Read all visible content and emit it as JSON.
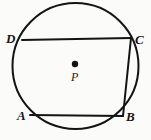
{
  "figure": {
    "type": "geometry-diagram",
    "width": 151,
    "height": 140,
    "background_color": "#fbfbfa",
    "stroke_color": "#141414",
    "fill_color": "none",
    "stroke_width": 2
  },
  "circle": {
    "name": "circle-P",
    "center_x": 75.5,
    "center_y": 66,
    "radius": 63,
    "stroke_color": "#141414",
    "stroke_width": 2
  },
  "center_point": {
    "name": "center-point-P",
    "label": "P",
    "dot_x": 75,
    "dot_y": 64,
    "dot_radius": 3.2,
    "color": "#141414"
  },
  "vertices": [
    {
      "label": "D",
      "x": 22,
      "y": 40,
      "label_x": 6,
      "label_y": 32
    },
    {
      "label": "C",
      "x": 131,
      "y": 38,
      "label_x": 135,
      "label_y": 33
    },
    {
      "label": "B",
      "x": 123,
      "y": 116,
      "label_x": 126,
      "label_y": 110
    },
    {
      "label": "A",
      "x": 30,
      "y": 115,
      "label_x": 17,
      "label_y": 109
    }
  ],
  "chords": [
    {
      "name": "chord-DC",
      "from": "D",
      "to": "C",
      "x1": 22,
      "y1": 40,
      "x2": 131,
      "y2": 38
    },
    {
      "name": "chord-CB",
      "from": "C",
      "to": "B",
      "x1": 131,
      "y1": 38,
      "x2": 123,
      "y2": 116
    },
    {
      "name": "chord-AB",
      "from": "A",
      "to": "B",
      "x1": 30,
      "y1": 115,
      "x2": 123,
      "y2": 116
    }
  ],
  "labels": {
    "D": "D",
    "C": "C",
    "B": "B",
    "A": "A",
    "P": "P"
  },
  "chart_data": {
    "type": "diagram",
    "title": "",
    "shapes": [
      {
        "kind": "circle",
        "id": "P",
        "cx": 75.5,
        "cy": 66,
        "r": 63
      },
      {
        "kind": "point",
        "id": "P",
        "x": 75,
        "y": 64
      },
      {
        "kind": "point",
        "id": "D",
        "x": 22,
        "y": 40
      },
      {
        "kind": "point",
        "id": "C",
        "x": 131,
        "y": 38
      },
      {
        "kind": "point",
        "id": "B",
        "x": 123,
        "y": 116
      },
      {
        "kind": "point",
        "id": "A",
        "x": 30,
        "y": 115
      },
      {
        "kind": "segment",
        "id": "DC",
        "from": "D",
        "to": "C"
      },
      {
        "kind": "segment",
        "id": "CB",
        "from": "C",
        "to": "B"
      },
      {
        "kind": "segment",
        "id": "AB",
        "from": "A",
        "to": "B"
      }
    ]
  }
}
